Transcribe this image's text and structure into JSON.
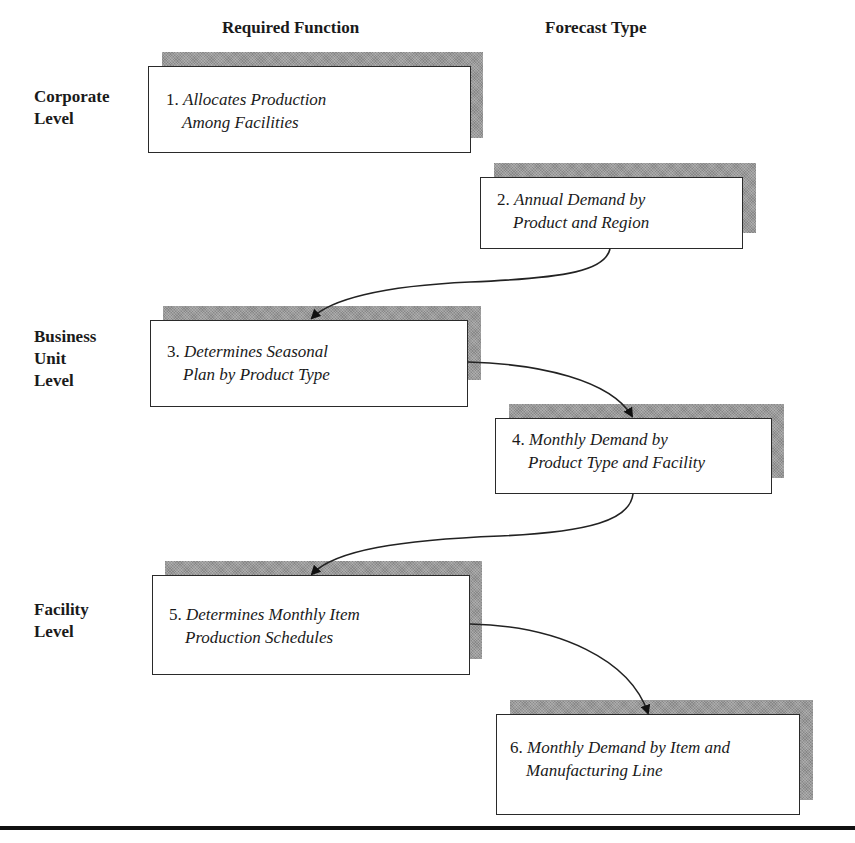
{
  "headers": {
    "required_function": "Required Function",
    "forecast_type": "Forecast Type"
  },
  "levels": [
    {
      "label": "Corporate\nLevel"
    },
    {
      "label": "Business\nUnit\nLevel"
    },
    {
      "label": "Facility\nLevel"
    }
  ],
  "boxes": [
    {
      "number": "1.",
      "line1": "Allocates Production",
      "line2": "Among Facilities",
      "column": "Required Function"
    },
    {
      "number": "2.",
      "line1": "Annual Demand by",
      "line2": "Product and Region",
      "column": "Forecast Type"
    },
    {
      "number": "3.",
      "line1": "Determines Seasonal",
      "line2": "Plan by Product Type",
      "column": "Required Function"
    },
    {
      "number": "4.",
      "line1": "Monthly Demand by",
      "line2": "Product Type and Facility",
      "column": "Forecast Type"
    },
    {
      "number": "5.",
      "line1": "Determines Monthly Item",
      "line2": "Production Schedules",
      "column": "Required Function"
    },
    {
      "number": "6.",
      "line1": "Monthly Demand by Item and",
      "line2": "Manufacturing Line",
      "column": "Forecast Type"
    }
  ],
  "connections": [
    {
      "from": "2",
      "to": "3"
    },
    {
      "from": "3",
      "to": "4"
    },
    {
      "from": "4",
      "to": "5"
    },
    {
      "from": "5",
      "to": "6"
    }
  ],
  "colors": {
    "shadow": "#9a9a9a",
    "border": "#2a2a2a",
    "text": "#1a1a1a",
    "rule": "#111111"
  }
}
